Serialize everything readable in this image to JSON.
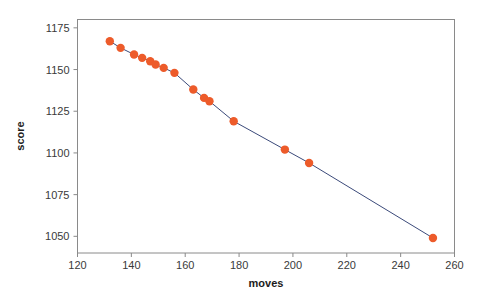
{
  "chart_data": {
    "type": "scatter",
    "title": "",
    "xlabel": "moves",
    "ylabel": "score",
    "xlim": [
      120,
      260
    ],
    "ylim": [
      1040,
      1180
    ],
    "xticks": [
      120,
      140,
      160,
      180,
      200,
      220,
      240,
      260
    ],
    "yticks": [
      1050,
      1075,
      1100,
      1125,
      1150,
      1175
    ],
    "xtick_labels": [
      "120",
      "140",
      "160",
      "180",
      "200",
      "220",
      "240",
      "260"
    ],
    "ytick_labels": [
      "1050",
      "1075",
      "1100",
      "1125",
      "1150",
      "1175"
    ],
    "grid": false,
    "legend": null,
    "series": [
      {
        "name": "score vs moves",
        "marker_color": "#ED5B2A",
        "line_color": "#3B4A7A",
        "marker_size": 4.2,
        "line_width": 1,
        "x": [
          132,
          136,
          141,
          144,
          147,
          149,
          152,
          156,
          163,
          167,
          169,
          178,
          197,
          206,
          252
        ],
        "y": [
          1167,
          1163,
          1159,
          1157,
          1155,
          1153,
          1151,
          1148,
          1138,
          1133,
          1131,
          1119,
          1102,
          1094,
          1049
        ]
      }
    ]
  },
  "axes": {
    "x_axis_label": "moves",
    "y_axis_label": "score"
  },
  "colors": {
    "marker": "#ED5B2A",
    "line": "#3B4A7A",
    "spine": "#8a8a8a",
    "tick_text": "#3a3a3a",
    "background": "#ffffff"
  }
}
